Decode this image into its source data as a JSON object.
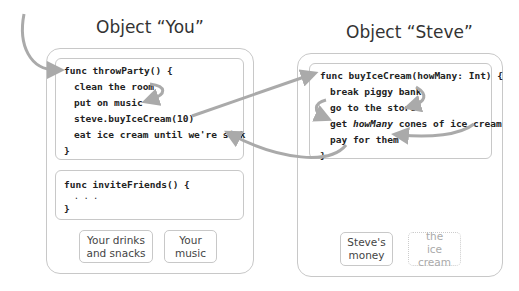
{
  "objects": {
    "you": {
      "title": "Object “You”",
      "throw_party": {
        "lines": [
          "func throwParty() {",
          "clean the room",
          "put on music",
          "steve.buyIceCream(10)",
          "eat ice cream until we're sick",
          "}"
        ]
      },
      "invite_friends": {
        "lines": [
          "func inviteFriends() {",
          ". . .",
          "}"
        ]
      },
      "items": [
        {
          "label": "Your drinks and snacks"
        },
        {
          "label": "Your music"
        }
      ]
    },
    "steve": {
      "title": "Object “Steve”",
      "buy_ice_cream": {
        "lines": [
          "func buyIceCream(howMany: Int) {",
          "break piggy bank",
          "go to the store",
          "get",
          "howMany",
          "cones of ice cream",
          "pay for them",
          "}"
        ]
      },
      "items": [
        {
          "label": "Steve's money"
        },
        {
          "label": "the ice cream"
        }
      ]
    }
  },
  "colors": {
    "arrow": "#aaaaaa",
    "border": "#c8c8c8"
  }
}
